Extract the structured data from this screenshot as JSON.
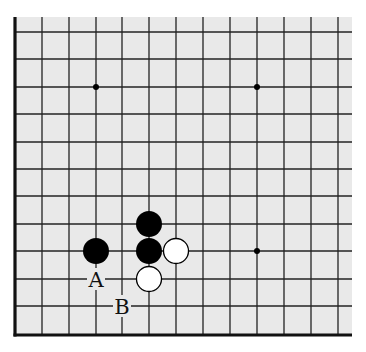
{
  "board": {
    "background": "#e9e9e9",
    "line_color": "#222222",
    "edge_color": "#111111",
    "x_lines": [
      42,
      69,
      96,
      122,
      149,
      176,
      203,
      230,
      257,
      284,
      311,
      338
    ],
    "y_lines": [
      32,
      59,
      87,
      114,
      142,
      169,
      196,
      224,
      251,
      279,
      306
    ],
    "edge_left_x": 15,
    "edge_bottom_y": 335,
    "area": {
      "x": 15,
      "y": 17,
      "w": 337,
      "h": 318
    },
    "star_points": [
      {
        "x": 96,
        "y": 87
      },
      {
        "x": 257,
        "y": 87
      },
      {
        "x": 257,
        "y": 251
      }
    ]
  },
  "stones": [
    {
      "color": "black",
      "x": 96,
      "y": 251
    },
    {
      "color": "black",
      "x": 149,
      "y": 224
    },
    {
      "color": "black",
      "x": 149,
      "y": 251
    },
    {
      "color": "white",
      "x": 176,
      "y": 251
    },
    {
      "color": "white",
      "x": 149,
      "y": 279
    }
  ],
  "labels": [
    {
      "text": "A",
      "x": 96,
      "y": 279
    },
    {
      "text": "B",
      "x": 122,
      "y": 306
    }
  ]
}
